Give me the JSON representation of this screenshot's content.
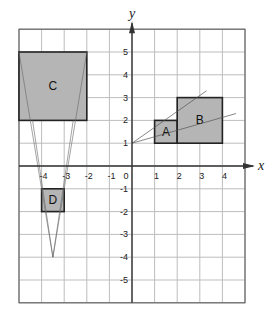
{
  "axes": {
    "x_label": "x",
    "y_label": "y",
    "x_ticks": [
      "-4",
      "-3",
      "-2",
      "-1",
      "0",
      "1",
      "2",
      "3",
      "4"
    ],
    "y_ticks": [
      "5",
      "4",
      "3",
      "2",
      "1",
      "-1",
      "-2",
      "-3",
      "-4",
      "-5"
    ],
    "x_range": [
      -5,
      5
    ],
    "y_range": [
      -6,
      6
    ]
  },
  "shapes": [
    {
      "label": "A",
      "x1": 1,
      "y1": 1,
      "x2": 2,
      "y2": 2
    },
    {
      "label": "B",
      "x1": 2,
      "y1": 1,
      "x2": 4,
      "y2": 3
    },
    {
      "label": "C",
      "x1": -5,
      "y1": 2,
      "x2": -2,
      "y2": 5
    },
    {
      "label": "D",
      "x1": -4,
      "y1": -2,
      "x2": -3,
      "y2": -1
    }
  ],
  "rays": {
    "center_AB": {
      "x": 0,
      "y": 1
    },
    "center_CD": {
      "x": -3.5,
      "y": -4
    }
  },
  "colors": {
    "fill": "#b5b5b5",
    "grid": "#bdbdbd",
    "border": "#444444"
  }
}
